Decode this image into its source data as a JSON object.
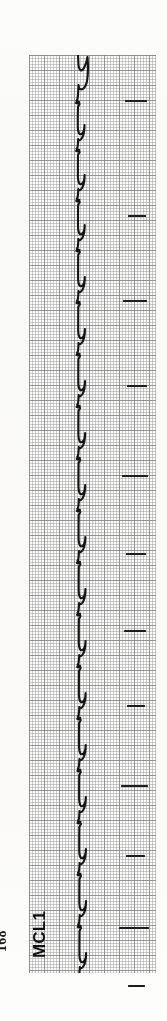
{
  "page": {
    "page_number": "168",
    "background_color": "#fbfbfa",
    "width": 167,
    "height": 1021
  },
  "ecg": {
    "lead_label": "MCL1",
    "trace_color": "#141414",
    "grid_minor_color": "#8c8a8c",
    "grid_major_color": "#787678",
    "grid_paper_color": "#fdfdfc",
    "orientation": "vertical-strip-rotated-90ccw",
    "grid": {
      "left": 29,
      "top": 55,
      "width": 127,
      "height": 918,
      "minor_cell_px": 3,
      "major_cell_px": 15,
      "minor_per_major": 5
    },
    "baseline_x": 49,
    "tick_marks": [
      {
        "x": 96,
        "y": 45,
        "width": 22
      },
      {
        "x": 99,
        "y": 160,
        "width": 18
      },
      {
        "x": 94,
        "y": 245,
        "width": 24
      },
      {
        "x": 98,
        "y": 330,
        "width": 20
      },
      {
        "x": 93,
        "y": 420,
        "width": 26
      },
      {
        "x": 97,
        "y": 498,
        "width": 20
      },
      {
        "x": 95,
        "y": 575,
        "width": 22
      },
      {
        "x": 98,
        "y": 650,
        "width": 18
      },
      {
        "x": 92,
        "y": 730,
        "width": 27
      },
      {
        "x": 97,
        "y": 800,
        "width": 19
      },
      {
        "x": 90,
        "y": 872,
        "width": 30
      },
      {
        "x": 99,
        "y": 930,
        "width": 17
      }
    ]
  },
  "chart_data": {
    "type": "line",
    "xlabel": "Time",
    "ylabel": "Amplitude (mV)",
    "lead": "MCL1",
    "orientation": "vertical",
    "paper_speed_mm_per_s": 25,
    "gain_mm_per_mV": 10,
    "grid": {
      "minor_mm": 1,
      "major_mm": 5,
      "on": true
    },
    "legend": {
      "entries": [
        "MCL1"
      ],
      "position": "left-rotated"
    },
    "annotations": [
      {
        "text": "168",
        "role": "page-number",
        "position": "bottom-left"
      },
      {
        "text": "MCL1",
        "role": "lead-label",
        "position": "bottom-left"
      }
    ],
    "beats": [
      {
        "index": 1,
        "t": 18,
        "qrs_amplitude": -0.9,
        "t_wave": 0.42
      },
      {
        "index": 2,
        "t": 88,
        "qrs_amplitude": -1.0,
        "t_wave": 0.4
      },
      {
        "index": 3,
        "t": 158,
        "qrs_amplitude": -0.95,
        "t_wave": 0.44
      },
      {
        "index": 4,
        "t": 228,
        "qrs_amplitude": -1.0,
        "t_wave": 0.4
      },
      {
        "index": 5,
        "t": 300,
        "qrs_amplitude": -0.92,
        "t_wave": 0.43
      },
      {
        "index": 6,
        "t": 372,
        "qrs_amplitude": -1.0,
        "t_wave": 0.41
      },
      {
        "index": 7,
        "t": 444,
        "qrs_amplitude": -0.97,
        "t_wave": 0.42
      },
      {
        "index": 8,
        "t": 516,
        "qrs_amplitude": -0.94,
        "t_wave": 0.4
      },
      {
        "index": 9,
        "t": 588,
        "qrs_amplitude": -1.0,
        "t_wave": 0.43
      },
      {
        "index": 10,
        "t": 660,
        "qrs_amplitude": -0.96,
        "t_wave": 0.41
      },
      {
        "index": 11,
        "t": 732,
        "qrs_amplitude": -0.98,
        "t_wave": 0.42
      },
      {
        "index": 12,
        "t": 804,
        "qrs_amplitude": -1.0,
        "t_wave": 0.4
      },
      {
        "index": 13,
        "t": 876,
        "qrs_amplitude": -0.95,
        "t_wave": 0.43
      }
    ],
    "trace_path": "M 49 0 L 49.5 10 C 50 16 53 17 55 13 C 57 9 58 6 58.5 2 C 59 8 59.5 18 58 26 C 56.5 34 52 36 50 33 L 49.5 30 L 49 40 L 48.5 44 L 47.5 46 L 50 47 L 47 48 L 50.5 49 L 49 52 L 48.8 60 L 48.8 72 C 49 78 50.5 80 52.5 79 C 54.5 78 55.5 74 55.5 70 C 55.5 75 55 80 53 83 C 51 86 49.5 85.5 49.2 84 L 49 88 L 48.6 92 L 47.6 94 L 50.2 95 L 47.2 96 L 50.6 97 L 49 100 L 48.9 110 L 48.9 122 C 49.1 128 50.6 130 52.6 129 C 54.6 128 55.6 124 55.6 120 C 55.6 125 55.1 130 53.1 133 C 51.1 136 49.6 135.5 49.3 134 L 49.1 138 L 48.7 142 L 47.7 144 L 50.3 145 L 47.3 146 L 50.7 147 L 49.1 150 L 49 160 L 49 172 C 49.2 178 50.7 180 52.7 179 C 54.7 178 55.7 174 55.7 170 C 55.7 175 55.2 180 53.2 183 C 51.2 186 49.7 185.5 49.4 184 L 49.2 188 L 48.8 192 L 47.8 194 L 50.4 195 L 47.4 196 L 50.8 197 L 49.2 200 L 49.1 212 L 49.1 224 C 49.3 230 50.8 232 52.8 231 C 54.8 230 55.8 226 55.8 222 C 55.8 227 55.3 232 53.3 235 C 51.3 238 49.8 237.5 49.5 236 L 49.3 240 L 48.9 244 L 47.9 246 L 50.5 247 L 47.5 248 L 50.9 249 L 49.3 252 L 49.2 264 L 49.2 276 C 49.4 282 50.9 284 52.9 283 C 54.9 282 55.9 278 55.9 274 C 55.9 279 55.4 284 53.4 287 C 51.4 290 49.9 289.5 49.6 288 L 49.4 292 L 49 296 L 48 298 L 50.6 299 L 47.6 300 L 51 301 L 49.4 304 L 49.3 316 L 49.3 328 C 49.5 334 51 336 53 335 C 55 334 56 330 56 326 C 56 331 55.5 336 53.5 339 C 51.5 342 50 341.5 49.7 340 L 49.5 344 L 49.1 348 L 48.1 350 L 50.7 351 L 47.7 352 L 51.1 353 L 49.5 356 L 49.4 368 L 49.4 380 C 49.6 386 51.1 388 53.1 387 C 55.1 386 56.1 382 56.1 378 C 56.1 383 55.6 388 53.6 391 C 51.6 394 50.1 393.5 49.8 392 L 49.6 396 L 49.2 400 L 48.2 402 L 50.8 403 L 47.8 404 L 51.2 405 L 49.6 408 L 49.5 420 L 49.5 432 C 49.7 438 51.2 440 53.2 439 C 55.2 438 56.2 434 56.2 430 C 56.2 435 55.7 440 53.7 443 C 51.7 446 50.2 445.5 49.9 444 L 49.7 448 L 49.3 452 L 48.3 454 L 50.9 455 L 47.9 456 L 51.3 457 L 49.7 460 L 49.6 472 L 49.6 484 C 49.8 490 51.3 492 53.3 491 C 55.3 490 56.3 486 56.3 482 C 56.3 487 55.8 492 53.8 495 C 51.8 498 50.3 497.5 50 496 L 49.8 500 L 49.4 504 L 48.4 506 L 51 507 L 48 508 L 51.4 509 L 49.8 512 L 49.7 524 L 49.7 536 C 49.9 542 51.4 544 53.4 543 C 55.4 542 56.4 538 56.4 534 C 56.4 539 55.9 544 53.9 547 C 51.9 550 50.4 549.5 50.1 548 L 49.9 552 L 49.5 556 L 48.5 558 L 51.1 559 L 48.1 560 L 51.5 561 L 49.9 564 L 49.8 576 L 49.8 588 C 50 594 51.5 596 53.5 595 C 55.5 594 56.5 590 56.5 586 C 56.5 591 56 596 54 599 C 52 602 50.5 601.5 50.2 600 L 50 604 L 49.6 608 L 48.6 610 L 51.2 611 L 48.2 612 L 51.6 613 L 50 616 L 49.9 628 L 49.9 640 C 50.1 646 51.6 648 53.6 647 C 55.6 646 56.6 642 56.6 638 C 56.6 643 56.1 648 54.1 651 C 52.1 654 50.6 653.5 50.3 652 L 50.1 656 L 49.7 660 L 48.7 662 L 51.3 663 L 48.3 664 L 51.7 665 L 50.1 668 L 50 680 L 50 692 C 50.2 698 51.7 700 53.7 699 C 55.7 698 56.7 694 56.7 690 C 56.7 695 56.2 700 54.2 703 C 52.2 706 50.7 705.5 50.4 704 L 50.2 708 L 49.8 712 L 48.8 714 L 51.4 715 L 48.4 716 L 51.8 717 L 50.2 720 L 50.1 732 L 50.1 744 C 50.3 750 51.8 752 53.8 751 C 55.8 750 56.8 746 56.8 742 C 56.8 747 56.3 752 54.3 755 C 52.3 758 50.8 757.5 50.5 756 L 50.3 760 L 49.9 764 L 48.9 766 L 51.5 767 L 48.5 768 L 51.9 769 L 50.3 772 L 50.2 784 L 50.2 796 C 50.4 802 51.9 804 53.9 803 C 55.9 802 56.9 798 56.9 794 C 56.9 799 56.4 804 54.4 807 C 52.4 810 50.9 809.5 50.6 808 L 50.4 812 L 50 816 L 49 818 L 51.6 819 L 48.6 820 L 52 821 L 50.4 824 L 50.3 836 L 50.3 848 C 50.5 854 52 856 54 855 C 56 854 57 850 57 846 C 57 851 56.5 856 54.5 859 C 52.5 862 51 861.5 50.7 860 L 50.5 864 L 50.1 868 L 49.1 870 L 51.7 871 L 48.7 872 L 52.1 873 L 50.5 876 L 50.4 888 L 50.4 900 C 50.6 906 52.1 908 54.1 907 C 56.1 906 57.1 902 57.1 898 C 57.1 903 56.6 908 54.6 911 C 52.6 914 51.1 913.5 50.8 912 L 50.6 916 L 50.2 918"
  }
}
